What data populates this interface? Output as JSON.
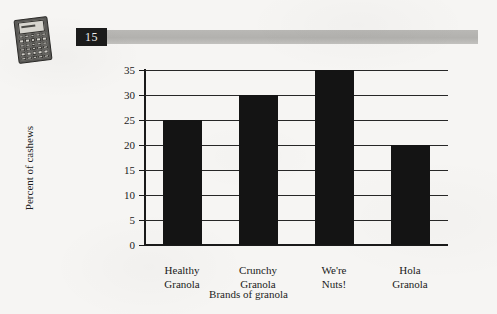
{
  "page": {
    "background_color": "#f6f5f3",
    "ink_color": "#1a1a1a"
  },
  "header": {
    "exercise_number": "15",
    "number_box_color": "#1b1b1b",
    "rule_color": "#b9b8b5"
  },
  "icons": {
    "calculator": "calculator-icon"
  },
  "chart_data": {
    "type": "bar",
    "title": "",
    "categories": [
      "Healthy Granola",
      "Crunchy Granola",
      "We're Nuts!",
      "Hola Granola"
    ],
    "category_lines": [
      [
        "Healthy",
        "Granola"
      ],
      [
        "Crunchy",
        "Granola"
      ],
      [
        "We're",
        "Nuts!"
      ],
      [
        "Hola",
        "Granola"
      ]
    ],
    "values": [
      25,
      30,
      35,
      20
    ],
    "xlabel": "Brands of granola",
    "ylabel": "Percent of cashews",
    "ylim": [
      0,
      35
    ],
    "yticks": [
      0,
      5,
      10,
      15,
      20,
      25,
      30,
      35
    ],
    "ytick_labels": [
      "0",
      "5",
      "10",
      "15",
      "20",
      "25",
      "30",
      "35"
    ],
    "grid": true,
    "legend": false,
    "bar_color": "#141414"
  }
}
